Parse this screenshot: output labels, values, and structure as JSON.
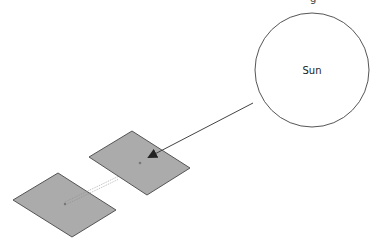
{
  "diagram": {
    "title_fragment": "g",
    "sun": {
      "label": "Sun",
      "cx": 312,
      "cy": 70,
      "r": 57,
      "stroke": "#555555",
      "fill": "#ffffff"
    },
    "ray": {
      "from": [
        253,
        103
      ],
      "to": [
        147,
        158
      ],
      "color": "#444444",
      "arrowhead": "filled-triangle"
    },
    "panels": [
      {
        "name": "upper-panel",
        "points": "132,131 190,168 147,195 89,157",
        "center": [
          140,
          163
        ],
        "fill": "#ababab",
        "stroke": "#555555"
      },
      {
        "name": "lower-panel",
        "points": "58,173 116,210 72,237 13,200",
        "center": [
          65,
          204
        ],
        "fill": "#ababab",
        "stroke": "#555555"
      }
    ],
    "link": {
      "from": [
        118,
        178
      ],
      "to": [
        65,
        204
      ],
      "style": "double-dotted",
      "color": "#888888"
    }
  }
}
